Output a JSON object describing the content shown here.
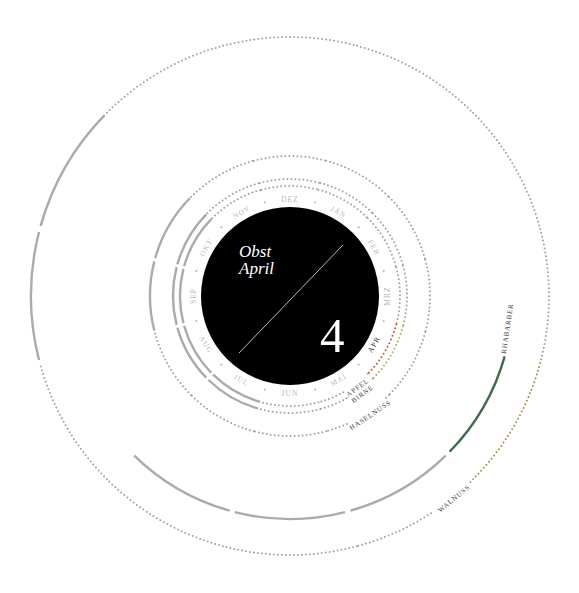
{
  "header": {
    "category": "Obst",
    "month_name": "April",
    "month_number": "4"
  },
  "colors": {
    "disc": "#000000",
    "center_text": "#ffffff",
    "divider": "#d0d0d0",
    "gray_dotted": "#a2a2a2",
    "gray_solid": "#ababab",
    "month_label": "#b9b9b9",
    "month_label_current": "#1e1e1e",
    "month_dot": "#bdbdbd"
  },
  "chart_data": {
    "type": "heatmap",
    "title": "Obst April",
    "subtitle": "4",
    "categories": [
      "JÄN",
      "FEB",
      "MRZ",
      "APR",
      "MAI",
      "JUN",
      "JUL",
      "AUG",
      "SEP",
      "OKT",
      "NOV",
      "DEZ"
    ],
    "current_month": "APR",
    "legend": {
      "season": "solid line",
      "off": "dotted line",
      "none": "no line"
    },
    "series": [
      {
        "name": "APFEL",
        "values": [
          "off",
          "off",
          "off",
          "off",
          "off",
          "off",
          "season",
          "season",
          "season",
          "season",
          "off",
          "off"
        ],
        "accent_color": "#d8503e",
        "label_angle": 143.5,
        "label_gap": [
          136,
          151
        ]
      },
      {
        "name": "BIRNE",
        "values": [
          "off",
          "off",
          "off",
          "off",
          "off",
          "off",
          "season",
          "season",
          "season",
          "season",
          "off",
          "off"
        ],
        "accent_color": "#b4b24c",
        "label_angle": 143.5,
        "label_gap": [
          136,
          151
        ]
      },
      {
        "name": "HASELNUSS",
        "values": [
          "off",
          "off",
          "off",
          "off",
          "off",
          "off",
          "off",
          "off",
          "season",
          "season",
          "off",
          "off"
        ],
        "accent_color": null,
        "label_angle": 146,
        "label_gap": [
          137,
          156
        ]
      },
      {
        "name": "RHABARBER",
        "values": [
          "none",
          "none",
          "none",
          "season",
          "season",
          "season",
          "season",
          "none",
          "none",
          "none",
          "none",
          "none"
        ],
        "accent_color": "#3f6b4f",
        "label_angle": 98.5,
        "label_gap": null
      },
      {
        "name": "WALNUSS",
        "values": [
          "off",
          "off",
          "off",
          "off",
          "off",
          "off",
          "off",
          "off",
          "season",
          "season",
          "off",
          "off"
        ],
        "accent_color": "#a8903e",
        "label_angle": 141,
        "label_gap": [
          136,
          147
        ]
      }
    ]
  }
}
